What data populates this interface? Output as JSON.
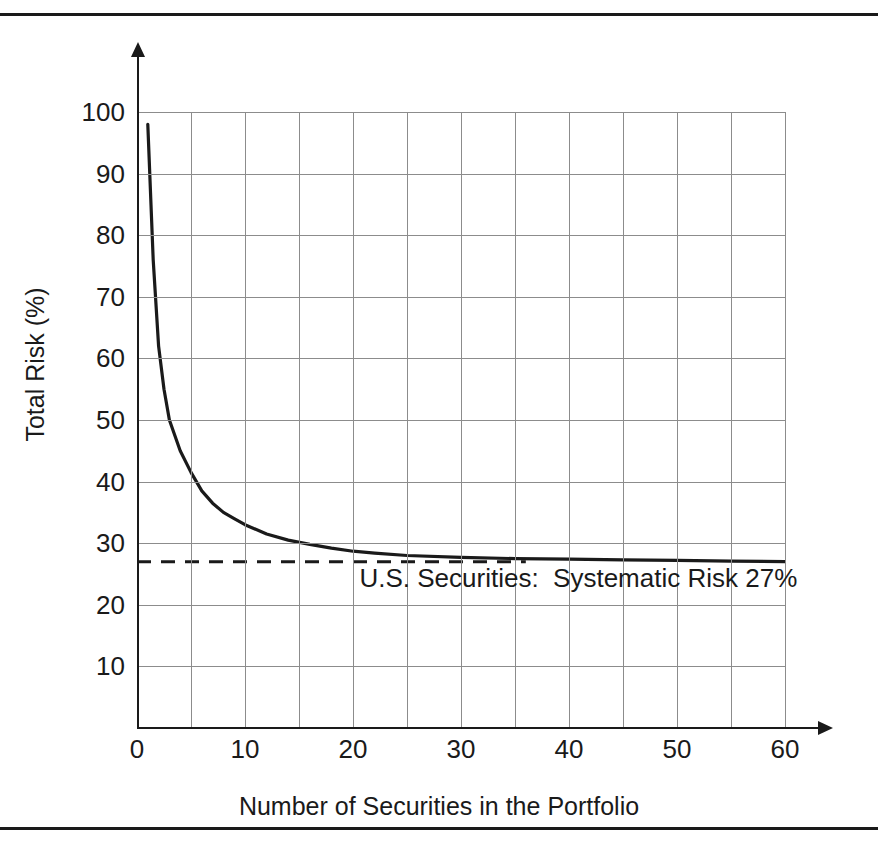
{
  "chart_data": {
    "type": "line",
    "title": "",
    "xlabel": "Number of Securities in the Portfolio",
    "ylabel": "Total Risk (%)",
    "xlim": [
      0,
      60
    ],
    "ylim": [
      0,
      100
    ],
    "grid": true,
    "grid_x_step": 5,
    "grid_y_step": 10,
    "legend": "none",
    "x_ticks": [
      "0",
      "10",
      "20",
      "30",
      "40",
      "50",
      "60"
    ],
    "x_tick_values": [
      0,
      10,
      20,
      30,
      40,
      50,
      60
    ],
    "y_ticks": [
      "10",
      "20",
      "30",
      "40",
      "50",
      "60",
      "70",
      "80",
      "90",
      "100"
    ],
    "y_tick_values": [
      10,
      20,
      30,
      40,
      50,
      60,
      70,
      80,
      90,
      100
    ],
    "series": [
      {
        "name": "Total Risk",
        "style": "solid",
        "color": "#1a1a1a",
        "x": [
          1,
          1.5,
          2,
          2.5,
          3,
          4,
          5,
          6,
          7,
          8,
          9,
          10,
          12,
          14,
          16,
          18,
          20,
          22,
          25,
          30,
          35,
          40,
          45,
          50,
          55,
          60
        ],
        "values": [
          98,
          76,
          62,
          55,
          50,
          45,
          41.5,
          38.5,
          36.5,
          35,
          34,
          33,
          31.5,
          30.5,
          29.8,
          29.2,
          28.7,
          28.4,
          28.0,
          27.7,
          27.5,
          27.4,
          27.3,
          27.2,
          27.1,
          27.0
        ]
      },
      {
        "name": "Systematic Risk",
        "style": "dashed",
        "color": "#1a1a1a",
        "x": [
          0,
          36
        ],
        "values": [
          27,
          27
        ]
      }
    ],
    "annotations": [
      {
        "text": "U.S. Securities:  Systematic Risk 27%",
        "x": 20.6,
        "y": 24.5
      }
    ],
    "systematic_risk_level": 27
  },
  "figure": {
    "x_axis_title": "Number of Securities in the Portfolio",
    "y_axis_title": "Total Risk (%)",
    "annotation_text": "U.S. Securities:  Systematic Risk 27%"
  },
  "axis": {
    "y_labels": [
      "100",
      "90",
      "80",
      "70",
      "60",
      "50",
      "40",
      "30",
      "20",
      "10"
    ],
    "x_labels": [
      "0",
      "10",
      "20",
      "30",
      "40",
      "50",
      "60"
    ]
  }
}
